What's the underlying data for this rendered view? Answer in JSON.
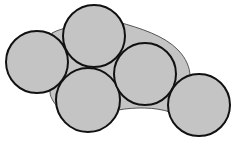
{
  "diagram": {
    "width": 234,
    "height": 141,
    "colors": {
      "background": "#ffffff",
      "fill": "#c4c4c4",
      "circle_stroke": "#111111",
      "hull_stroke": "#555555"
    },
    "hull": {
      "path": "M 52 33 C 58 30, 62 29, 66 28 L 118 22 C 140 28, 165 36, 178 50 C 186 58, 190 68, 190 76 L 170 112 C 155 107, 135 107, 118 110 L 60 110 C 55 104, 50 98, 50 92 Z"
    },
    "circles": [
      {
        "id": "left",
        "cx": 37,
        "cy": 62,
        "r": 31
      },
      {
        "id": "top",
        "cx": 94,
        "cy": 36,
        "r": 31
      },
      {
        "id": "bottom-center",
        "cx": 88,
        "cy": 100,
        "r": 32
      },
      {
        "id": "right-center",
        "cx": 145,
        "cy": 74,
        "r": 31
      },
      {
        "id": "far-right",
        "cx": 199,
        "cy": 105,
        "r": 31
      }
    ]
  }
}
